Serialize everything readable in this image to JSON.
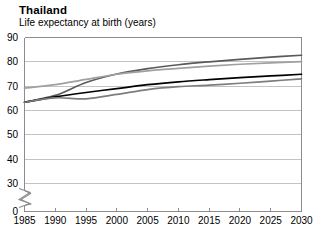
{
  "chart_title": "Thailand",
  "chart_subtitle": "Life expectancy at birth (years)",
  "chart_data": {
    "type": "line",
    "title": "Thailand",
    "subtitle": "Life expectancy at birth (years)",
    "xlabel": "",
    "ylabel": "Life expectancy at birth (years)",
    "xlim": [
      1985,
      2030
    ],
    "ylim": [
      0,
      90
    ],
    "y_axis_break": true,
    "y_break_between": [
      0,
      30
    ],
    "grid": true,
    "legend": "none",
    "x": [
      1985,
      1990,
      1995,
      2000,
      2005,
      2010,
      2015,
      2020,
      2025,
      2030
    ],
    "xtick_labels": [
      "1985",
      "1990",
      "1995",
      "2000",
      "2005",
      "2010",
      "2015",
      "2020",
      "2025",
      "2030"
    ],
    "ytick_labels": [
      "0",
      "30",
      "40",
      "50",
      "60",
      "70",
      "80",
      "90"
    ],
    "ytick_values": [
      0,
      30,
      40,
      50,
      60,
      70,
      80,
      90
    ],
    "series": [
      {
        "name": "Female life expectancy (estimate)",
        "color": "#5a5a5a",
        "values": [
          63.4,
          66.2,
          71.5,
          75.0,
          77.2,
          78.8,
          80.0,
          81.0,
          81.9,
          82.7
        ]
      },
      {
        "name": "Female life expectancy (alternative)",
        "color": "#a0a0a0",
        "values": [
          69.2,
          70.6,
          72.8,
          74.9,
          76.3,
          77.3,
          78.2,
          79.0,
          79.6,
          80.1
        ]
      },
      {
        "name": "Male life expectancy (estimate)",
        "color": "#000000",
        "values": [
          63.4,
          65.6,
          67.4,
          69.0,
          70.6,
          71.8,
          72.7,
          73.5,
          74.2,
          74.9
        ]
      },
      {
        "name": "Male life expectancy (alternative)",
        "color": "#7d7d7d",
        "values": [
          63.4,
          65.2,
          64.8,
          66.6,
          68.6,
          69.8,
          70.4,
          71.2,
          72.1,
          73.0
        ]
      }
    ]
  }
}
